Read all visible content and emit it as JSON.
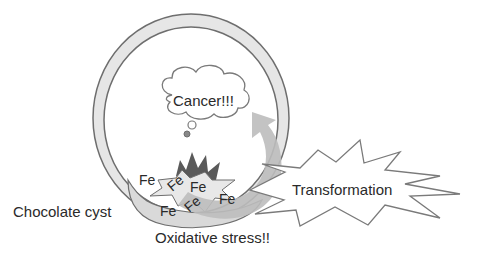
{
  "diagram": {
    "labels": {
      "cancer": "Cancer!!!",
      "transformation": "Transformation",
      "chocolate_cyst": "Chocolate cyst",
      "oxidative_stress": "Oxidative stress!!"
    },
    "iron_symbols": [
      "Fe",
      "Fe",
      "Fe",
      "Fe",
      "Fe",
      "Fe"
    ],
    "colors": {
      "outline": "#6e6e6e",
      "ring_fill": "#e6e6e6",
      "arrow_fill": "#bdbdbd",
      "dark_burst": "#5a5a5a",
      "text": "#2a2a2a",
      "background": "#ffffff"
    }
  }
}
